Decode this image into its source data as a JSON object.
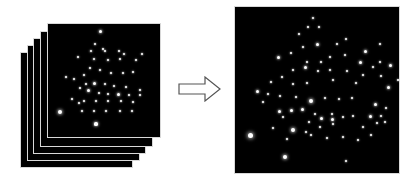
{
  "diagram": {
    "colors": {
      "background": "#ffffff",
      "frame_fill": "#000000",
      "frame_border": "#d8d8d8",
      "spot": "#ffffff",
      "arrow_stroke": "#555555",
      "arrow_fill": "#ffffff"
    },
    "stack": {
      "frame_count": 5,
      "frames": [
        {
          "x": 20,
          "y": 52,
          "w": 113,
          "h": 116
        },
        {
          "x": 27,
          "y": 45,
          "w": 113,
          "h": 116
        },
        {
          "x": 33,
          "y": 38,
          "w": 113,
          "h": 116
        },
        {
          "x": 40,
          "y": 31,
          "w": 113,
          "h": 116
        },
        {
          "x": 47,
          "y": 23,
          "w": 114,
          "h": 115
        }
      ],
      "front_spots": [
        [
          52,
          7,
          1.5
        ],
        [
          47,
          20,
          1
        ],
        [
          55,
          25,
          1
        ],
        [
          43,
          27,
          1.2
        ],
        [
          57,
          27,
          1
        ],
        [
          71,
          27,
          1
        ],
        [
          76,
          30,
          1.2
        ],
        [
          30,
          33,
          1
        ],
        [
          46,
          35,
          1.2
        ],
        [
          60,
          36,
          1.2
        ],
        [
          72,
          35,
          1
        ],
        [
          88,
          36,
          1
        ],
        [
          85,
          48,
          1
        ],
        [
          94,
          30,
          1
        ],
        [
          42,
          44,
          1
        ],
        [
          52,
          46,
          1
        ],
        [
          63,
          49,
          1
        ],
        [
          75,
          49,
          1
        ],
        [
          36,
          51,
          1
        ],
        [
          26,
          55,
          1
        ],
        [
          18,
          53,
          1
        ],
        [
          38,
          60,
          1
        ],
        [
          46,
          59,
          1.5
        ],
        [
          57,
          60,
          1
        ],
        [
          66,
          62,
          1
        ],
        [
          78,
          63,
          1
        ],
        [
          92,
          66,
          1
        ],
        [
          32,
          64,
          1
        ],
        [
          40,
          66,
          1.5
        ],
        [
          51,
          69,
          1
        ],
        [
          60,
          70,
          1
        ],
        [
          70,
          70,
          1.5
        ],
        [
          81,
          71,
          1
        ],
        [
          92,
          71,
          1
        ],
        [
          24,
          75,
          1
        ],
        [
          36,
          77,
          1
        ],
        [
          48,
          77,
          1
        ],
        [
          60,
          77,
          1
        ],
        [
          73,
          77,
          1
        ],
        [
          85,
          78,
          1
        ],
        [
          34,
          87,
          1
        ],
        [
          46,
          87,
          1
        ],
        [
          58,
          87,
          1
        ],
        [
          72,
          87,
          1
        ],
        [
          84,
          87,
          1
        ],
        [
          12,
          88,
          2
        ],
        [
          48,
          100,
          1.6
        ],
        [
          31,
          79,
          1
        ]
      ]
    },
    "arrow": {
      "direction": "right",
      "style": "outlined block arrow"
    },
    "result": {
      "frame": {
        "x": 234,
        "y": 6,
        "w": 166,
        "h": 168
      },
      "spots": [
        [
          78,
          11,
          1.2
        ],
        [
          73,
          20,
          1
        ],
        [
          84,
          20,
          1
        ],
        [
          64,
          27,
          1
        ],
        [
          82,
          37,
          1.5
        ],
        [
          68,
          40,
          1
        ],
        [
          102,
          37,
          1
        ],
        [
          111,
          32,
          1
        ],
        [
          130,
          44,
          1.5
        ],
        [
          145,
          37,
          1
        ],
        [
          43,
          50,
          1.5
        ],
        [
          56,
          46,
          1
        ],
        [
          72,
          55,
          1
        ],
        [
          86,
          55,
          1
        ],
        [
          95,
          50,
          1
        ],
        [
          110,
          48,
          1
        ],
        [
          125,
          55,
          1.5
        ],
        [
          145,
          55,
          1
        ],
        [
          138,
          60,
          1
        ],
        [
          155,
          58,
          1.5
        ],
        [
          58,
          63,
          1
        ],
        [
          70,
          60,
          1.5
        ],
        [
          83,
          64,
          1
        ],
        [
          95,
          63,
          1
        ],
        [
          112,
          64,
          1
        ],
        [
          128,
          68,
          1
        ],
        [
          146,
          69,
          1
        ],
        [
          163,
          73,
          1
        ],
        [
          47,
          70,
          1
        ],
        [
          36,
          75,
          1
        ],
        [
          58,
          77,
          1
        ],
        [
          72,
          76,
          1
        ],
        [
          98,
          73,
          1
        ],
        [
          121,
          76,
          1
        ],
        [
          153,
          80,
          1.5
        ],
        [
          168,
          78,
          1
        ],
        [
          22,
          84,
          1.5
        ],
        [
          33,
          87,
          1
        ],
        [
          45,
          89,
          1
        ],
        [
          61,
          90,
          1
        ],
        [
          76,
          94,
          2
        ],
        [
          90,
          91,
          1
        ],
        [
          104,
          92,
          1
        ],
        [
          117,
          91,
          1
        ],
        [
          140,
          97,
          1.5
        ],
        [
          151,
          101,
          1
        ],
        [
          28,
          95,
          1
        ],
        [
          44,
          104,
          1.5
        ],
        [
          56,
          103,
          1.5
        ],
        [
          67,
          102,
          1.5
        ],
        [
          80,
          107,
          1
        ],
        [
          97,
          107,
          1
        ],
        [
          118,
          109,
          1
        ],
        [
          146,
          109,
          1.2
        ],
        [
          48,
          110,
          1
        ],
        [
          74,
          115,
          1
        ],
        [
          86,
          111,
          1.5
        ],
        [
          97,
          112,
          1.5
        ],
        [
          108,
          110,
          1
        ],
        [
          135,
          109,
          1.5
        ],
        [
          150,
          115,
          1
        ],
        [
          38,
          121,
          1
        ],
        [
          58,
          123,
          2
        ],
        [
          71,
          125,
          1
        ],
        [
          85,
          120,
          1
        ],
        [
          98,
          117,
          1
        ],
        [
          128,
          120,
          1
        ],
        [
          142,
          116,
          1
        ],
        [
          52,
          132,
          1
        ],
        [
          76,
          128,
          1
        ],
        [
          92,
          131,
          1
        ],
        [
          108,
          130,
          1
        ],
        [
          123,
          133,
          1
        ],
        [
          136,
          128,
          1
        ],
        [
          15,
          128,
          2.5
        ],
        [
          50,
          150,
          2
        ],
        [
          111,
          154,
          1
        ]
      ]
    }
  }
}
